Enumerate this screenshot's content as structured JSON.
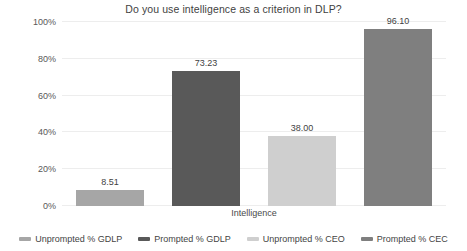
{
  "chart_data": {
    "type": "bar",
    "title": "Do you use intelligence as a criterion in DLP?",
    "xlabel": "Intelligence",
    "ylabel": "",
    "categories": [
      "Intelligence"
    ],
    "ylim": [
      0,
      100
    ],
    "ytick_labels": [
      "0%",
      "20%",
      "40%",
      "60%",
      "80%",
      "100%"
    ],
    "ytick_values": [
      0,
      20,
      40,
      60,
      80,
      100
    ],
    "grid": true,
    "legend_position": "bottom",
    "data_labels": [
      "8.51",
      "73.23",
      "38.00",
      "96.10"
    ],
    "series": [
      {
        "name": "Unprompted % GDLP",
        "values": [
          8.51
        ],
        "label": "8.51",
        "color": "#a6a6a6"
      },
      {
        "name": "Prompted % GDLP",
        "values": [
          73.23
        ],
        "label": "73.23",
        "color": "#595959"
      },
      {
        "name": "Unprompted % CEO",
        "values": [
          38.0
        ],
        "label": "38.00",
        "color": "#cfcfcf"
      },
      {
        "name": "Prompted % CEC",
        "values": [
          96.1
        ],
        "label": "96.10",
        "color": "#7f7f7f"
      }
    ]
  },
  "legend": {
    "items": [
      {
        "label": "Unprompted % GDLP",
        "color": "#a6a6a6"
      },
      {
        "label": "Prompted % GDLP",
        "color": "#595959"
      },
      {
        "label": "Unprompted % CEO",
        "color": "#cfcfcf"
      },
      {
        "label": "Prompted % CEC",
        "color": "#7f7f7f"
      }
    ]
  },
  "colors": {
    "background": "#ffffff",
    "gridline": "#ededed",
    "text": "#3f3f3f"
  }
}
